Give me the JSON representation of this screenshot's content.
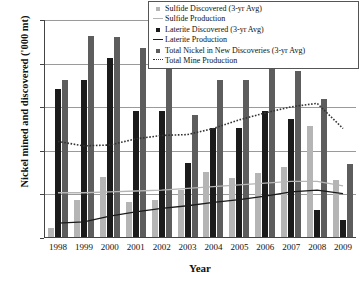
{
  "chart_data": {
    "type": "bar",
    "title": "",
    "xlabel": "Year",
    "ylabel": "Nickel mined and discovered ('000 mt)",
    "categories": [
      "1998",
      "1999",
      "2000",
      "2001",
      "2002",
      "2003",
      "2004",
      "2005",
      "2006",
      "2007",
      "2008",
      "2009"
    ],
    "ylim": [
      0,
      2500
    ],
    "yticks": [
      0,
      500,
      1000,
      1500,
      2000,
      2500
    ],
    "ytick_labels": [
      "0",
      "500",
      "1,000",
      "1,500",
      "2,000",
      "2,500"
    ],
    "grid": true,
    "legend_position": "top-right",
    "series": [
      {
        "name": "Sulfide Discovered (3-yr Avg)",
        "kind": "bar",
        "color": "#b5b5b5",
        "values": [
          100,
          420,
          690,
          400,
          430,
          540,
          740,
          680,
          730,
          800,
          1270,
          650
        ]
      },
      {
        "name": "Laterite Discovered (3-yr Avg)",
        "kind": "bar",
        "color": "#1b1b1b",
        "values": [
          1700,
          1800,
          2050,
          1450,
          1450,
          850,
          1250,
          1250,
          1450,
          1350,
          310,
          190
        ]
      },
      {
        "name": "Total Nickel in New Discoveries (3-yr Avg)",
        "kind": "bar",
        "color": "#5d5d5d",
        "values": [
          1800,
          2300,
          2290,
          2170,
          2160,
          1400,
          1800,
          1800,
          2250,
          1900,
          1580,
          840
        ]
      },
      {
        "name": "Sulfide Production",
        "kind": "line",
        "color": "#b5b5b5",
        "style": "solid",
        "values": [
          510,
          510,
          520,
          530,
          540,
          560,
          580,
          600,
          620,
          640,
          640,
          590
        ]
      },
      {
        "name": "Laterite Production",
        "kind": "line",
        "color": "#1b1b1b",
        "style": "solid",
        "values": [
          160,
          175,
          240,
          290,
          330,
          360,
          400,
          430,
          470,
          520,
          540,
          500
        ]
      },
      {
        "name": "Total Mine Production",
        "kind": "line",
        "color": "#333333",
        "style": "dotted",
        "values": [
          1100,
          1050,
          1060,
          1130,
          1170,
          1180,
          1250,
          1350,
          1430,
          1500,
          1540,
          1250
        ]
      }
    ]
  },
  "legend": {
    "groups": [
      {
        "marker_label": "Sulfide Discovered (3-yr Avg)",
        "marker_kind": "sulfide",
        "line_label": "Sulfide Production",
        "line_kind": "sulfide"
      },
      {
        "marker_label": "Laterite Discovered (3-yr Avg)",
        "marker_kind": "laterite",
        "line_label": "Laterite Production",
        "line_kind": "laterite"
      },
      {
        "marker_label": "Total Nickel in New Discoveries (3-yr Avg)",
        "marker_kind": "total",
        "line_label": "Total Mine Production",
        "line_kind": "total"
      }
    ]
  }
}
